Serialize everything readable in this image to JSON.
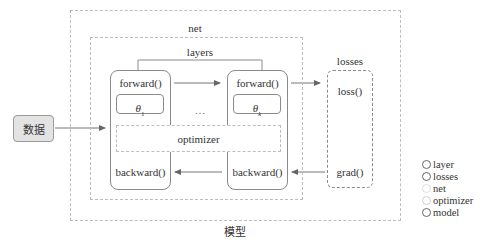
{
  "diagram": {
    "model_label": "模型",
    "net_label": "net",
    "layers_label": "layers",
    "losses_label": "losses",
    "input_label": "数据",
    "ellipsis": "…",
    "layer_first": {
      "forward": "forward()",
      "param": "θ",
      "param_sub": "1",
      "backward": "backward()"
    },
    "layer_last": {
      "forward": "forward()",
      "param": "θ",
      "param_sub": "k",
      "backward": "backward()"
    },
    "optimizer_label": "optimizer",
    "losses": {
      "loss": "loss()",
      "grad": "grad()"
    }
  },
  "legend": {
    "items": [
      {
        "label": "layer",
        "style": "solid-dark"
      },
      {
        "label": "losses",
        "style": "solid-dark"
      },
      {
        "label": "net",
        "style": "light"
      },
      {
        "label": "optimizer",
        "style": "light"
      },
      {
        "label": "model",
        "style": "solid-dark"
      }
    ]
  },
  "colors": {
    "dark_line": "#8a8a8a",
    "light_dash": "#bdbdbd",
    "input_fill": "#e3e3e3",
    "text": "#333333"
  }
}
